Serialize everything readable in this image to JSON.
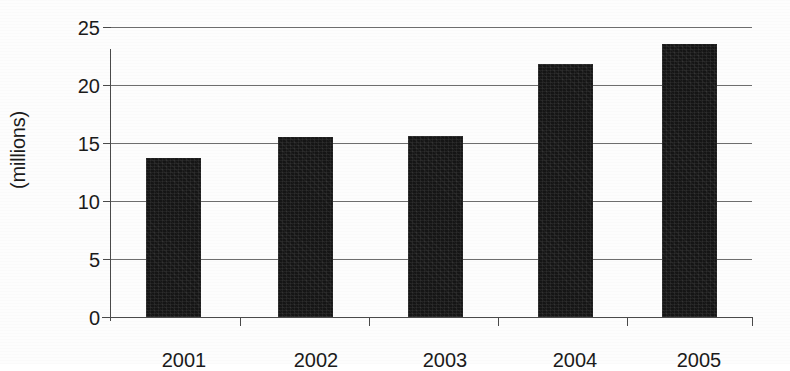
{
  "chart_data": {
    "type": "bar",
    "title": "",
    "subtitle": "",
    "xlabel": "",
    "ylabel": "(millions)",
    "categories": [
      "2001",
      "2002",
      "2003",
      "2004",
      "2005"
    ],
    "values": [
      13.7,
      15.5,
      15.6,
      21.8,
      23.5
    ],
    "ylim": [
      0,
      25
    ],
    "y_ticks": [
      0,
      5,
      10,
      15,
      20,
      25
    ],
    "y_tick_labels": [
      "0",
      "5",
      "10",
      "15",
      "20",
      "25"
    ],
    "grid": "horizontal",
    "legend": "none",
    "bar_color": "#151515",
    "axis_color": "#4a4a4a",
    "gridline_color": "#6e6e6e",
    "background_color": "#fdfdfd",
    "annotations": []
  },
  "axes": {
    "y_title": "(millions)",
    "y_tick_labels": [
      "25",
      "20",
      "15",
      "10",
      "5",
      "0"
    ],
    "x_tick_labels": [
      "2001",
      "2002",
      "2003",
      "2004",
      "2005"
    ]
  },
  "bars": [
    {
      "category": "2001",
      "value": 13.7,
      "label": "2001"
    },
    {
      "category": "2002",
      "value": 15.5,
      "label": "2002"
    },
    {
      "category": "2003",
      "value": 15.6,
      "label": "2003"
    },
    {
      "category": "2004",
      "value": 21.8,
      "label": "2004"
    },
    {
      "category": "2005",
      "value": 23.5,
      "label": "2005"
    }
  ]
}
